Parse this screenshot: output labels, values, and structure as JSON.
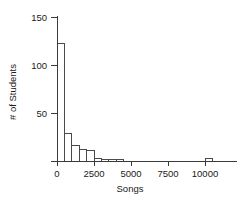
{
  "chart_data": {
    "type": "bar",
    "title": "",
    "xlabel": "Songs",
    "ylabel": "# of Students",
    "xlim": [
      -500,
      11500
    ],
    "ylim": [
      0,
      155
    ],
    "grid": false,
    "legend": null,
    "bin_width": 500,
    "xticks": [
      0,
      2500,
      5000,
      7500,
      10000
    ],
    "xtick_labels": [
      "0",
      "2500",
      "5000",
      "7500",
      "10000"
    ],
    "yticks": [
      50,
      100,
      150
    ],
    "ytick_labels": [
      "50",
      "100",
      "150"
    ],
    "bins": [
      {
        "start": 0,
        "end": 500,
        "value": 122
      },
      {
        "start": 500,
        "end": 1000,
        "value": 29
      },
      {
        "start": 1000,
        "end": 1500,
        "value": 16
      },
      {
        "start": 1500,
        "end": 2000,
        "value": 12
      },
      {
        "start": 2000,
        "end": 2500,
        "value": 11
      },
      {
        "start": 2500,
        "end": 3000,
        "value": 3
      },
      {
        "start": 3000,
        "end": 3500,
        "value": 2
      },
      {
        "start": 3500,
        "end": 4000,
        "value": 2
      },
      {
        "start": 4000,
        "end": 4500,
        "value": 2
      },
      {
        "start": 10000,
        "end": 10500,
        "value": 3
      }
    ],
    "categories": [
      "0-500",
      "500-1000",
      "1000-1500",
      "1500-2000",
      "2000-2500",
      "2500-3000",
      "3000-3500",
      "3500-4000",
      "4000-4500",
      "10000-10500"
    ],
    "values": [
      122,
      29,
      16,
      12,
      11,
      3,
      2,
      2,
      2,
      3
    ],
    "colors": {
      "bar_fill": "#ffffff",
      "bar_stroke": "#4a4a4a",
      "axis": "#3a3a3a",
      "text": "#1a1a1a",
      "background": "#ffffff"
    }
  }
}
